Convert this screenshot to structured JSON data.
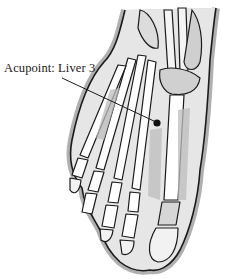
{
  "diagram": {
    "annotation": {
      "label": "Acupoint: Liver 3",
      "point": {
        "x": 157,
        "y": 123
      },
      "leader_start": {
        "x": 62,
        "y": 78
      }
    },
    "colors": {
      "outline": "#1a1a1a",
      "shadow": "#b5b5b5",
      "fill": "#ffffff",
      "dot": "#111111"
    }
  }
}
